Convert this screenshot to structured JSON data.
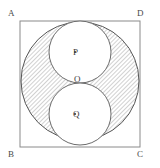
{
  "figure": {
    "square": {
      "vertices": [
        {
          "name": "A",
          "label": "A",
          "position": "top-left"
        },
        {
          "name": "D",
          "label": "D",
          "position": "top-right"
        },
        {
          "name": "B",
          "label": "B",
          "position": "bottom-left"
        },
        {
          "name": "C",
          "label": "C",
          "position": "bottom-right"
        }
      ],
      "x": 20,
      "y": 21,
      "size": 120,
      "stroke": "#8a8a8a",
      "stroke_width": 1
    },
    "big_circle": {
      "name": "inscribed-circle",
      "cx": 80,
      "cy": 81,
      "r": 59,
      "stroke": "#555555",
      "fill": "none"
    },
    "small_circles": [
      {
        "name": "circle-p",
        "center_label": "P",
        "dot": true,
        "cx": 80,
        "cy": 52,
        "r": 31,
        "stroke": "#6b6b6b",
        "fill": "#ffffff"
      },
      {
        "name": "circle-q",
        "center_label": "Q",
        "dot": true,
        "cx": 80,
        "cy": 114,
        "r": 31,
        "stroke": "#6b6b6b",
        "fill": "#ffffff"
      }
    ],
    "tangent_point": {
      "name": "O",
      "label": "O",
      "cx": 80,
      "cy": 83
    },
    "shading": {
      "description": "region between inscribed circle and the two inner circles",
      "pattern": "diagonal-hatch",
      "hatch_color": "#9a9a9a",
      "hatch_spacing": 3,
      "hatch_angle": 45,
      "background": "#ffffff"
    },
    "colors": {
      "line": "#555555",
      "square_line": "#8a8a8a",
      "label": "#3d3d3d",
      "hatch": "#9a9a9a",
      "page_background": "#ffffff"
    }
  }
}
